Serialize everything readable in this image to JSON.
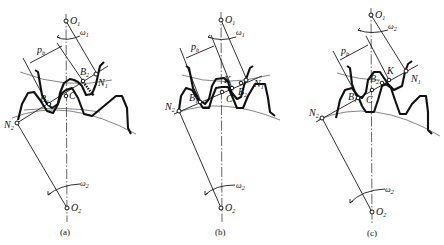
{
  "figure": {
    "panels": [
      {
        "caption": "(a)",
        "labels": {
          "o1": "O",
          "o1_sub": "1",
          "o2": "O",
          "o2_sub": "2",
          "w1": "ω",
          "w1_sub": "1",
          "w2": "ω",
          "w2_sub": "2",
          "pb": "p",
          "pb_sub": "b",
          "n1": "N",
          "n1_sub": "1",
          "n2": "N",
          "n2_sub": "2",
          "b1": "B",
          "b1_sub": "1",
          "b2": "B",
          "b2_sub": "2",
          "c": "C"
        }
      },
      {
        "caption": "(b)",
        "labels": {
          "o1": "O",
          "o1_sub": "1",
          "o2": "O",
          "o2_sub": "2",
          "w1": "ω",
          "w1_sub": "1",
          "w2": "ω",
          "w2_sub": "2",
          "pb": "p",
          "pb_sub": "b",
          "n1": "N",
          "n1_sub": "1",
          "n2": "N",
          "n2_sub": "2",
          "b1": "B",
          "b1_sub": "1",
          "b2": "B",
          "b2_sub": "2",
          "c": "C",
          "k": "K"
        }
      },
      {
        "caption": "(c)",
        "labels": {
          "o1": "O",
          "o1_sub": "1",
          "o2": "O",
          "o2_sub": "2",
          "w1": "ω",
          "w1_sub": "2",
          "w2": "ω",
          "w2_sub": "2",
          "pb": "p",
          "pb_sub": "b",
          "n1": "N",
          "n1_sub": "1",
          "n2": "N",
          "n2_sub": "2",
          "b1": "B",
          "b1_sub": "1",
          "b2": "B",
          "b2_sub": "2",
          "c": "C",
          "k": "K"
        }
      }
    ]
  }
}
